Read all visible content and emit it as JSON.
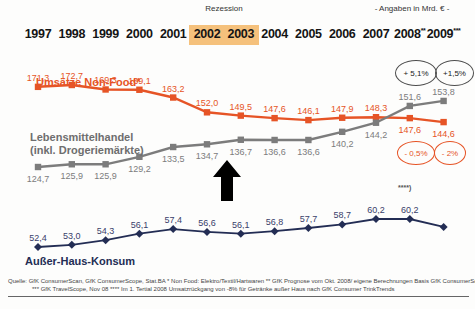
{
  "header": {
    "recession_label": "Rezession",
    "units_note": "- Angaben in Mrd. € -"
  },
  "chart_data": {
    "type": "line",
    "x_labels": [
      "1997",
      "1998",
      "1999",
      "2000",
      "2001",
      "2002",
      "2003",
      "2004",
      "2005",
      "2006",
      "2007",
      "2008**",
      "2009***"
    ],
    "recession_years": [
      "2002",
      "2003"
    ],
    "recession_highlight_color": "#F5C17C",
    "legend_position": "on-chart",
    "grid": false,
    "series": [
      {
        "name": "Umsätze Non-Food*",
        "name_lines": [
          "Umsätze Non-Food*"
        ],
        "color": "#E65426",
        "values": [
          171.3,
          172.7,
          169.3,
          169.1,
          163.2,
          152.0,
          149.5,
          147.6,
          146.1,
          147.9,
          148.3,
          147.6,
          144.6
        ],
        "labels": [
          "171,3",
          "172,7",
          "169,3",
          "169,1",
          "163,2",
          "152,0",
          "149,5",
          "147,6",
          "146,1",
          "147,9",
          "148,3",
          "147,6",
          "144,6"
        ]
      },
      {
        "name": "Lebensmittelhandel (inkl. Drogeriemärkte)",
        "name_lines": [
          "Lebensmittelhandel",
          "(inkl. Drogeriemärkte)"
        ],
        "color": "#7C7C7C",
        "values": [
          124.7,
          125.9,
          125.9,
          129.2,
          133.5,
          134.7,
          136.7,
          136.6,
          136.6,
          140.2,
          144.2,
          151.6,
          153.8
        ],
        "labels": [
          "124,7",
          "125,9",
          "125,9",
          "129,2",
          "133,5",
          "134,7",
          "136,7",
          "136,6",
          "136,6",
          "140,2",
          "144,2",
          "151,6",
          "153,8"
        ]
      },
      {
        "name": "Außer-Haus-Konsum",
        "name_lines": [
          "Außer-Haus-Konsum"
        ],
        "color": "#232D54",
        "values": [
          52.4,
          53.0,
          54.3,
          56.1,
          57.4,
          56.6,
          56.1,
          56.8,
          57.7,
          58.7,
          60.2,
          60.2,
          58.0
        ],
        "labels": [
          "52,4",
          "53,0",
          "54,3",
          "56,1",
          "57,4",
          "56,6",
          "56,1",
          "56,8",
          "57,7",
          "58,7",
          "60,2",
          "60,2",
          ""
        ]
      }
    ],
    "annotations": {
      "gray_badges": [
        "+ 5,1%",
        "+1,5%"
      ],
      "orange_badges": [
        "- 0,5%",
        "- 2%"
      ],
      "footnote_marker": "****)"
    }
  },
  "footer": {
    "line1": "Quelle: GfK ConsumerScan, GfK ConsumerScope, Stat.BA     * Non Food: Elektro/Textil/Hartwaren     ** GfK Prognose vom Okt. 2008/ eigene Berechnungen Basis GfK ConsumerScan",
    "line2": "*** GfK TravelScope, Nov 08     **** Im 1. Tertial 2008 Umsatzrückgang von -8% für Getränke außer Haus nach GfK Consumer TrinkTrends"
  }
}
